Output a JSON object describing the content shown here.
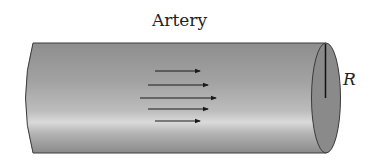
{
  "diagram": {
    "title": "Artery",
    "radius_label": "R",
    "flow_arrows": [
      {
        "x1": 155,
        "x2": 200,
        "y": 71
      },
      {
        "x1": 148,
        "x2": 208,
        "y": 85
      },
      {
        "x1": 140,
        "x2": 216,
        "y": 98
      },
      {
        "x1": 148,
        "x2": 208,
        "y": 109
      },
      {
        "x1": 155,
        "x2": 200,
        "y": 121
      }
    ],
    "colors": {
      "body_dark": "#8c8c8c",
      "body_light": "#d8d8d8",
      "end_cap": "#8a8a8a",
      "outline": "#3a3a3a",
      "arrow": "#1a1a1a"
    }
  }
}
